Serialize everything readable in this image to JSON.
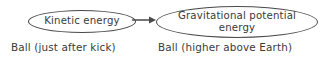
{
  "diagram": {
    "type": "energy-transfer-flow",
    "background_color": "#ffffff",
    "ink_color": "#3a3a3a",
    "stroke_color": "#4a4a4a",
    "nodes": [
      {
        "id": "kinetic",
        "label": "Kinetic energy",
        "shape": "ellipse",
        "caption": "Ball (just after kick)"
      },
      {
        "id": "gravitational_potential",
        "label": "Gravitational potential\nenergy",
        "shape": "ellipse",
        "caption": "Ball (higher above Earth)"
      }
    ],
    "connector": {
      "id": "kinetic-to-gpe",
      "style": "straight-line",
      "head": "solid-triangle",
      "direction": "right",
      "label": ""
    }
  }
}
